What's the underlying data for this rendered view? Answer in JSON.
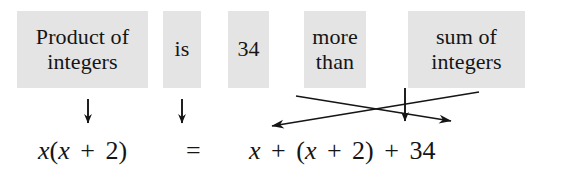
{
  "diagram": {
    "box_fill": "#e4e4e4",
    "ink": "#151515",
    "background": "#ffffff",
    "phrases": [
      {
        "name": "product-of-integers",
        "lines": [
          "Product of",
          "integers"
        ]
      },
      {
        "name": "is",
        "lines": [
          "is"
        ]
      },
      {
        "name": "thirty-four",
        "lines": [
          "34"
        ]
      },
      {
        "name": "more-than",
        "lines": [
          "more",
          "than"
        ]
      },
      {
        "name": "sum-of-integers",
        "lines": [
          "sum of",
          "integers"
        ]
      }
    ],
    "equation": {
      "left_side": {
        "name": "left-expression",
        "parts": [
          "x",
          "(",
          "x",
          "+",
          "2",
          ")"
        ],
        "text": "x(x + 2)"
      },
      "relation": {
        "name": "equals-sign",
        "text": "="
      },
      "right_side": {
        "name": "right-expression",
        "parts": [
          "x",
          "+",
          "(",
          "x",
          "+",
          "2",
          ")",
          "+",
          "34"
        ],
        "text": "x + (x + 2) + 34"
      }
    },
    "arrows": {
      "down_product": {
        "name": "down-arrow-product",
        "direction": "down"
      },
      "down_is": {
        "name": "down-arrow-is",
        "direction": "down"
      },
      "down_more_than": {
        "name": "down-arrow-more-than",
        "direction": "down"
      },
      "cross_thirty_four": {
        "name": "cross-arrow-thirty-four",
        "direction": "down-right"
      },
      "cross_sum": {
        "name": "cross-arrow-sum-of-integers",
        "direction": "down-left"
      }
    }
  }
}
